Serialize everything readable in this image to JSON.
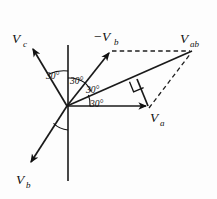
{
  "figure": {
    "type": "phasor-diagram",
    "title": "",
    "background_color": "#fdfdfd",
    "stroke_color": "#1a1a1a",
    "width": 217,
    "height": 199
  },
  "origin": {
    "x": 67,
    "y": 106
  },
  "labels": {
    "vc": {
      "base": "V",
      "sub": "c",
      "x": 14,
      "y": 42
    },
    "vb_neg": {
      "base": "−V",
      "sub": "b",
      "x": 96,
      "y": 40
    },
    "vab": {
      "base": "V",
      "sub": "ab",
      "x": 186,
      "y": 42
    },
    "va": {
      "base": "V",
      "sub": "a",
      "x": 152,
      "y": 121
    },
    "vb": {
      "base": "V",
      "sub": "b",
      "x": 18,
      "y": 183
    }
  },
  "angles": [
    {
      "id": "angle-vc-axis",
      "text": "30°",
      "x": 55,
      "y": 76
    },
    {
      "id": "angle-axis-negvb",
      "text": "30°",
      "x": 74,
      "y": 81
    },
    {
      "id": "angle-negvb-vab",
      "text": "30°",
      "x": 90,
      "y": 89
    },
    {
      "id": "angle-vab-va",
      "text": "30°",
      "x": 95,
      "y": 103
    }
  ],
  "vectors": [
    {
      "id": "vector-vc",
      "name": "V_c",
      "from": [
        67,
        106
      ],
      "to": [
        32,
        47
      ],
      "arrow": true,
      "style": "solid"
    },
    {
      "id": "vector-neg-vb",
      "name": "-V_b",
      "from": [
        67,
        106
      ],
      "to": [
        110,
        51
      ],
      "arrow": true,
      "style": "solid"
    },
    {
      "id": "vector-vab",
      "name": "V_ab",
      "from": [
        67,
        106
      ],
      "to": [
        192,
        51
      ],
      "arrow": false,
      "style": "solid"
    },
    {
      "id": "vector-va",
      "name": "V_a",
      "from": [
        67,
        106
      ],
      "to": [
        148,
        106
      ],
      "arrow": true,
      "style": "solid"
    },
    {
      "id": "vector-vb",
      "name": "V_b",
      "from": [
        67,
        106
      ],
      "to": [
        30,
        164
      ],
      "arrow": true,
      "style": "solid"
    },
    {
      "id": "vector-perpendicular",
      "name": "perpendicular-drop",
      "from": [
        148,
        106
      ],
      "to": [
        137,
        79
      ],
      "arrow": false,
      "style": "solid"
    }
  ],
  "axis": {
    "id": "vertical-axis",
    "from": [
      68,
      45
    ],
    "to": [
      68,
      181
    ]
  },
  "dashed": [
    {
      "id": "dash-negvb-to-vab",
      "from": [
        112,
        51
      ],
      "to": [
        190,
        51
      ]
    },
    {
      "id": "dash-va-to-vab",
      "from": [
        149,
        108
      ],
      "to": [
        191,
        53
      ]
    }
  ],
  "right_angle": {
    "id": "right-angle-marker",
    "vertex": [
      137,
      79
    ],
    "size": 11
  }
}
